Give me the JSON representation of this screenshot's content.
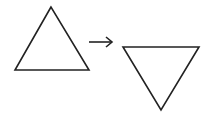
{
  "diagram": {
    "stroke_color": "#222222",
    "background": "#ffffff",
    "shapes": [
      {
        "id": "triangle-up",
        "points": [
          [
            51,
            7
          ],
          [
            15,
            70
          ],
          [
            89,
            70
          ]
        ]
      },
      {
        "id": "arrow",
        "from": [
          89,
          42
        ],
        "to": [
          112,
          42
        ]
      },
      {
        "id": "triangle-down",
        "points": [
          [
            123,
            47
          ],
          [
            199,
            47
          ],
          [
            161,
            110
          ]
        ]
      }
    ]
  }
}
